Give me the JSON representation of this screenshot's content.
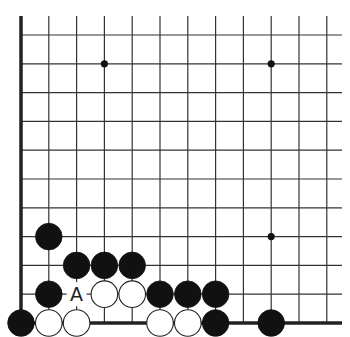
{
  "board": {
    "origin": {
      "x": 21,
      "y": 35
    },
    "spacing": {
      "x": 27.8,
      "y": 28.8
    },
    "columns": 12,
    "rows": 11,
    "top_edge_y": 16,
    "right_extent_x": 342,
    "edges": [
      "left",
      "bottom"
    ],
    "line_color": "#333333",
    "edge_color": "#222222",
    "black_color": "#111111",
    "white_fill": "#ffffff"
  },
  "star_points": [
    {
      "col": 3,
      "row": 1
    },
    {
      "col": 9,
      "row": 1
    },
    {
      "col": 9,
      "row": 7
    }
  ],
  "stones": [
    {
      "color": "black",
      "col": 1,
      "row": 7
    },
    {
      "color": "black",
      "col": 2,
      "row": 8
    },
    {
      "color": "black",
      "col": 3,
      "row": 8
    },
    {
      "color": "black",
      "col": 4,
      "row": 8
    },
    {
      "color": "black",
      "col": 1,
      "row": 9
    },
    {
      "color": "white",
      "col": 3,
      "row": 9
    },
    {
      "color": "white",
      "col": 4,
      "row": 9
    },
    {
      "color": "black",
      "col": 5,
      "row": 9
    },
    {
      "color": "black",
      "col": 6,
      "row": 9
    },
    {
      "color": "black",
      "col": 7,
      "row": 9
    },
    {
      "color": "black",
      "col": 0,
      "row": 10
    },
    {
      "color": "white",
      "col": 1,
      "row": 10
    },
    {
      "color": "white",
      "col": 2,
      "row": 10
    },
    {
      "color": "white",
      "col": 5,
      "row": 10
    },
    {
      "color": "white",
      "col": 6,
      "row": 10
    },
    {
      "color": "black",
      "col": 7,
      "row": 10
    },
    {
      "color": "black",
      "col": 9,
      "row": 10
    }
  ],
  "labels": [
    {
      "text": "A",
      "col": 2,
      "row": 9
    }
  ]
}
